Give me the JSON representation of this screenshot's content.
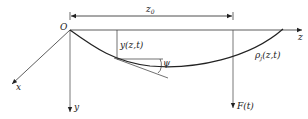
{
  "diagram": {
    "origin_label": "O",
    "axes": {
      "z": "z",
      "x": "x",
      "y": "y"
    },
    "dimension": {
      "label_main": "z",
      "label_sub": "0"
    },
    "deflection_label": "y(z,t)",
    "angle_label": "ψ",
    "density_label_main": "ρ",
    "density_label_sub": "j",
    "density_label_args": "(z,t)",
    "force_label": "F(t)",
    "colors": {
      "line": "#222222",
      "axis": "#555555"
    }
  }
}
